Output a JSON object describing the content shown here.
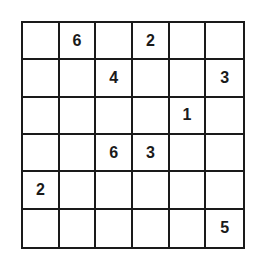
{
  "puzzle": {
    "size": 6,
    "grid": [
      [
        "",
        "6",
        "",
        "2",
        "",
        ""
      ],
      [
        "",
        "",
        "4",
        "",
        "",
        "3"
      ],
      [
        "",
        "",
        "",
        "",
        "1",
        ""
      ],
      [
        "",
        "",
        "6",
        "3",
        "",
        ""
      ],
      [
        "2",
        "",
        "",
        "",
        "",
        ""
      ],
      [
        "",
        "",
        "",
        "",
        "",
        "5"
      ]
    ]
  }
}
